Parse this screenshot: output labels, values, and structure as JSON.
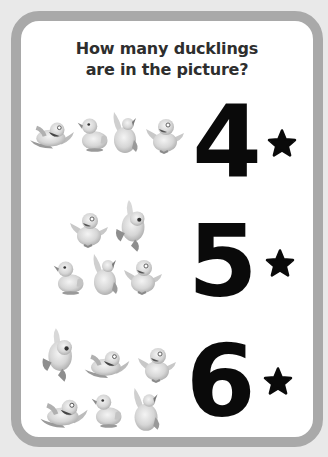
{
  "title": {
    "line1": "How many ducklings",
    "line2": "are in the picture?"
  },
  "rows": [
    {
      "number": "4",
      "duck_count": 4,
      "star": "star-icon"
    },
    {
      "number": "5",
      "duck_count": 5,
      "star": "star-icon"
    },
    {
      "number": "6",
      "duck_count": 6,
      "star": "star-icon"
    }
  ],
  "colors": {
    "frame": "#a9a9a9",
    "background": "#e9e9e9",
    "card": "#ffffff",
    "numeral": "#0a0a0a",
    "title": "#2e2e2e"
  }
}
